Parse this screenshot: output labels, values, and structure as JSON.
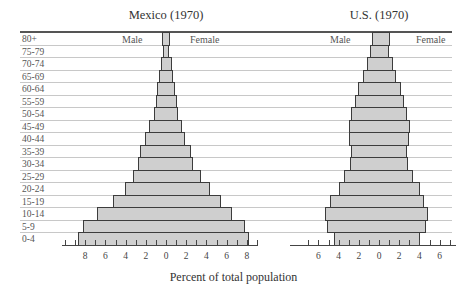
{
  "chart_data": {
    "type": "bar",
    "subtype": "population-pyramid",
    "xlabel": "Percent of total population",
    "age_groups": [
      "80+",
      "75-79",
      "70-74",
      "65-69",
      "60-64",
      "55-59",
      "50-54",
      "45-49",
      "40-44",
      "35-39",
      "30-34",
      "25-29",
      "20-24",
      "15-19",
      "10-14",
      "5-9",
      "0-4"
    ],
    "charts": [
      {
        "title": "Mexico (1970)",
        "left_label": "Male",
        "right_label": "Female",
        "xlim": [
          -8,
          8
        ],
        "tick_labels": [
          "8",
          "6",
          "4",
          "2",
          "0",
          "2",
          "4",
          "6",
          "8"
        ],
        "series": [
          {
            "name": "Male",
            "values": [
              0.4,
              0.3,
              0.5,
              0.7,
              0.9,
              1.0,
              1.2,
              1.7,
              2.1,
              2.6,
              2.8,
              3.3,
              4.1,
              5.2,
              6.8,
              8.2,
              8.7
            ]
          },
          {
            "name": "Female",
            "values": [
              0.4,
              0.3,
              0.6,
              0.7,
              0.9,
              1.1,
              1.2,
              1.6,
              1.9,
              2.5,
              2.7,
              3.5,
              4.4,
              5.4,
              6.5,
              7.8,
              8.2
            ]
          }
        ]
      },
      {
        "title": "U.S. (1970)",
        "left_label": "Male",
        "right_label": "Female",
        "xlim": [
          -6,
          6
        ],
        "tick_labels": [
          "6",
          "4",
          "2",
          "0",
          "2",
          "4",
          "6"
        ],
        "series": [
          {
            "name": "Male",
            "values": [
              0.7,
              0.9,
              1.2,
              1.6,
              2.1,
              2.4,
              2.8,
              3.0,
              3.0,
              2.8,
              2.9,
              3.5,
              4.0,
              4.9,
              5.3,
              5.1,
              4.5
            ]
          },
          {
            "name": "Female",
            "values": [
              1.1,
              1.0,
              1.4,
              1.7,
              2.2,
              2.5,
              2.8,
              3.1,
              3.0,
              2.8,
              2.9,
              3.4,
              4.1,
              4.5,
              4.9,
              4.7,
              4.1
            ]
          }
        ]
      }
    ],
    "grid": true,
    "legend": "none"
  }
}
